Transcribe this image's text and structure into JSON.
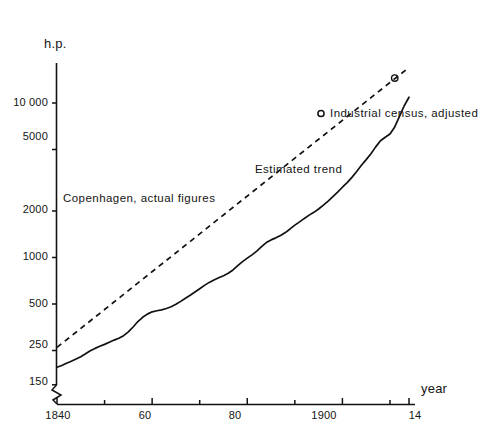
{
  "chart_data": {
    "type": "line",
    "title": "",
    "subtitle": "",
    "xlabel": "year",
    "ylabel": "h.p.",
    "yscale": "log",
    "xscale": "linear",
    "grid": false,
    "legend_position": "inline-annotations",
    "axis_break": "y-axis broken below 150",
    "xlim": [
      1840,
      1914
    ],
    "ylim": [
      150,
      25000
    ],
    "y_ticks": [
      {
        "value": 10000,
        "label": "10 000"
      },
      {
        "value": 5000,
        "label": "5000"
      },
      {
        "value": 2000,
        "label": "2000"
      },
      {
        "value": 1000,
        "label": "1000"
      },
      {
        "value": 500,
        "label": "500"
      },
      {
        "value": 250,
        "label": "250"
      },
      {
        "value": 150,
        "label": "150"
      }
    ],
    "x_ticks": [
      {
        "value": 1840,
        "label": "1840",
        "major": true
      },
      {
        "value": 1850,
        "label": "",
        "major": false
      },
      {
        "value": 1860,
        "label": "60",
        "major": true
      },
      {
        "value": 1870,
        "label": "",
        "major": false
      },
      {
        "value": 1880,
        "label": "80",
        "major": true
      },
      {
        "value": 1890,
        "label": "",
        "major": false
      },
      {
        "value": 1900,
        "label": "1900",
        "major": true
      },
      {
        "value": 1910,
        "label": "",
        "major": false
      },
      {
        "value": 1914,
        "label": "14",
        "major": true
      }
    ],
    "series": [
      {
        "name": "Copenhagen, actual figures",
        "style": "solid",
        "color": "#111111",
        "points": [
          [
            1840,
            195
          ],
          [
            1841,
            200
          ],
          [
            1842,
            207
          ],
          [
            1843,
            213
          ],
          [
            1844,
            220
          ],
          [
            1845,
            228
          ],
          [
            1846,
            238
          ],
          [
            1847,
            249
          ],
          [
            1848,
            258
          ],
          [
            1849,
            266
          ],
          [
            1850,
            274
          ],
          [
            1851,
            283
          ],
          [
            1852,
            292
          ],
          [
            1853,
            300
          ],
          [
            1854,
            312
          ],
          [
            1855,
            330
          ],
          [
            1856,
            355
          ],
          [
            1857,
            385
          ],
          [
            1858,
            410
          ],
          [
            1859,
            430
          ],
          [
            1860,
            445
          ],
          [
            1861,
            452
          ],
          [
            1862,
            458
          ],
          [
            1863,
            468
          ],
          [
            1864,
            480
          ],
          [
            1865,
            498
          ],
          [
            1866,
            520
          ],
          [
            1867,
            545
          ],
          [
            1868,
            570
          ],
          [
            1869,
            598
          ],
          [
            1870,
            628
          ],
          [
            1871,
            660
          ],
          [
            1872,
            690
          ],
          [
            1873,
            716
          ],
          [
            1874,
            740
          ],
          [
            1875,
            762
          ],
          [
            1876,
            790
          ],
          [
            1877,
            830
          ],
          [
            1878,
            885
          ],
          [
            1879,
            940
          ],
          [
            1880,
            990
          ],
          [
            1881,
            1040
          ],
          [
            1882,
            1100
          ],
          [
            1883,
            1175
          ],
          [
            1884,
            1250
          ],
          [
            1885,
            1300
          ],
          [
            1886,
            1340
          ],
          [
            1887,
            1390
          ],
          [
            1888,
            1450
          ],
          [
            1889,
            1530
          ],
          [
            1890,
            1620
          ],
          [
            1891,
            1700
          ],
          [
            1892,
            1790
          ],
          [
            1893,
            1880
          ],
          [
            1894,
            1960
          ],
          [
            1895,
            2060
          ],
          [
            1896,
            2180
          ],
          [
            1897,
            2320
          ],
          [
            1898,
            2480
          ],
          [
            1899,
            2650
          ],
          [
            1900,
            2850
          ],
          [
            1901,
            3050
          ],
          [
            1902,
            3300
          ],
          [
            1903,
            3600
          ],
          [
            1904,
            3950
          ],
          [
            1905,
            4300
          ],
          [
            1906,
            4700
          ],
          [
            1907,
            5200
          ],
          [
            1908,
            5700
          ],
          [
            1909,
            6000
          ],
          [
            1910,
            6300
          ],
          [
            1911,
            7000
          ],
          [
            1912,
            8200
          ],
          [
            1913,
            9600
          ],
          [
            1914,
            10900
          ]
        ]
      },
      {
        "name": "Estimated trend",
        "style": "dashed",
        "color": "#111111",
        "points": [
          [
            1840,
            262
          ],
          [
            1914,
            17000
          ]
        ]
      }
    ],
    "markers": [
      {
        "name": "Industrial census, adjusted",
        "shape": "open-circle",
        "points": [
          [
            1911,
            14500
          ]
        ]
      }
    ],
    "annotations": [
      {
        "id": "series-actual",
        "text": "Copenhagen, actual figures"
      },
      {
        "id": "series-trend",
        "text": "Estimated trend"
      },
      {
        "id": "series-census",
        "text": "Industrial census, adjusted"
      }
    ]
  },
  "axes": {
    "y_axis_title": "h.p.",
    "x_axis_title": "year"
  }
}
